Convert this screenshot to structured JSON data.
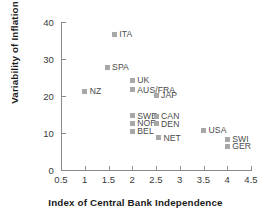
{
  "chart_data": {
    "type": "scatter",
    "title": "",
    "xlabel": "Index of Central Bank Independence",
    "ylabel": "Variability of Inflation",
    "xlim": [
      0.5,
      4.5
    ],
    "ylim": [
      0,
      40
    ],
    "xticks": [
      "0.5",
      "1",
      "1.5",
      "2",
      "2.5",
      "3",
      "3.5",
      "4",
      "4.5"
    ],
    "xtick_values": [
      0.5,
      1,
      1.5,
      2,
      2.5,
      3,
      3.5,
      4,
      4.5
    ],
    "yticks": [
      "0",
      "10",
      "20",
      "30",
      "40"
    ],
    "ytick_values": [
      0,
      10,
      20,
      30,
      40
    ],
    "grid": false,
    "legend": "none",
    "marker_color": "#a8a8a8",
    "axis_color": "#8a8a8a",
    "label_color": "#4a4a4a",
    "points": [
      {
        "label": "ITA",
        "x": 1.62,
        "y": 37.0
      },
      {
        "label": "SPA",
        "x": 1.47,
        "y": 28.0
      },
      {
        "label": "NZ",
        "x": 1.0,
        "y": 21.5
      },
      {
        "label": "UK",
        "x": 2.0,
        "y": 24.5
      },
      {
        "label": "AUS/FRA",
        "x": 2.0,
        "y": 22.0
      },
      {
        "label": "JAP",
        "x": 2.5,
        "y": 20.5
      },
      {
        "label": "SWE",
        "x": 2.0,
        "y": 15.0
      },
      {
        "label": "CAN",
        "x": 2.5,
        "y": 14.8
      },
      {
        "label": "NOR",
        "x": 2.0,
        "y": 13.0
      },
      {
        "label": "DEN",
        "x": 2.5,
        "y": 12.8
      },
      {
        "label": "BEL",
        "x": 2.0,
        "y": 10.8
      },
      {
        "label": "NET",
        "x": 2.55,
        "y": 9.0
      },
      {
        "label": "USA",
        "x": 3.5,
        "y": 11.0
      },
      {
        "label": "SWI",
        "x": 4.0,
        "y": 8.6
      },
      {
        "label": "GER",
        "x": 4.0,
        "y": 6.8
      }
    ]
  }
}
